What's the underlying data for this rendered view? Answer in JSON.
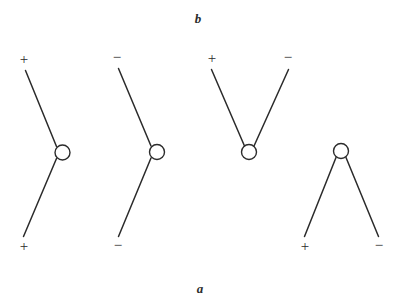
{
  "figure": {
    "title": "",
    "background_color": "#ffffff",
    "stroke_color": "#2b2b2b",
    "axis_labels": {
      "top": "b",
      "bottom": "a"
    },
    "signs": {
      "plus": "+",
      "minus": "−"
    },
    "diagrams": [
      {
        "id": "diagram-1",
        "shape": "bent-vertical-open-left",
        "node": {
          "cx": 62.5,
          "cy": 152.5,
          "r": 7.5
        },
        "endpoints": [
          {
            "name": "top",
            "sign": "+",
            "label_x": 24,
            "label_y": 64,
            "line_x": 25.5,
            "line_y": 70.5
          },
          {
            "name": "bottom",
            "sign": "+",
            "label_x": 24,
            "label_y": 251,
            "line_x": 23.5,
            "line_y": 236.5
          }
        ]
      },
      {
        "id": "diagram-2",
        "shape": "bent-vertical-open-left",
        "node": {
          "cx": 157,
          "cy": 152,
          "r": 7.5
        },
        "endpoints": [
          {
            "name": "top",
            "sign": "−",
            "label_x": 117,
            "label_y": 62,
            "line_x": 118.5,
            "line_y": 68.5
          },
          {
            "name": "bottom",
            "sign": "−",
            "label_x": 118,
            "label_y": 250,
            "line_x": 118.5,
            "line_y": 236.5
          }
        ]
      },
      {
        "id": "diagram-3",
        "shape": "v-open-up",
        "node": {
          "cx": 249,
          "cy": 152,
          "r": 7.5
        },
        "endpoints": [
          {
            "name": "top-left",
            "sign": "+",
            "label_x": 209,
            "label_y": 63,
            "line_x": 211.5,
            "line_y": 69.5
          },
          {
            "name": "top-right",
            "sign": "−",
            "label_x": 285,
            "label_y": 62,
            "line_x": 288.5,
            "line_y": 69.5
          }
        ]
      },
      {
        "id": "diagram-4",
        "shape": "lambda-open-down",
        "node": {
          "cx": 341,
          "cy": 151,
          "r": 7.5
        },
        "endpoints": [
          {
            "name": "bottom-left",
            "sign": "+",
            "label_x": 302,
            "label_y": 251,
            "line_x": 304.5,
            "line_y": 236.5
          },
          {
            "name": "bottom-right",
            "sign": "−",
            "label_x": 376,
            "label_y": 250,
            "line_x": 378.5,
            "line_y": 236.5
          }
        ]
      }
    ]
  }
}
